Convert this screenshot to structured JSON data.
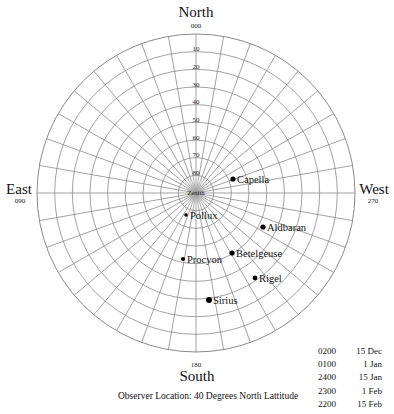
{
  "directions": {
    "north": {
      "label": "North",
      "degrees": "000"
    },
    "east": {
      "label": "East",
      "degrees": "090"
    },
    "west": {
      "label": "West",
      "degrees": "270"
    },
    "south": {
      "label": "South",
      "degrees": "180"
    }
  },
  "zenith_label": "Zenith",
  "altitude_labels": [
    "10",
    "20",
    "30",
    "40",
    "50",
    "60",
    "70",
    "80"
  ],
  "stars": [
    {
      "name": "Capella",
      "x": 233,
      "y": 179,
      "size": 2.6
    },
    {
      "name": "Pollux",
      "x": 186,
      "y": 215,
      "size": 1.8
    },
    {
      "name": "Aldbaran",
      "x": 263,
      "y": 227,
      "size": 2.6
    },
    {
      "name": "Betelgeuse",
      "x": 232,
      "y": 253,
      "size": 2.6
    },
    {
      "name": "Procyon",
      "x": 183,
      "y": 259,
      "size": 2.0
    },
    {
      "name": "Rigel",
      "x": 255,
      "y": 278,
      "size": 2.4
    },
    {
      "name": "Sirius",
      "x": 209,
      "y": 300,
      "size": 3.0
    }
  ],
  "observer_location": "Observer Location: 40 Degrees North Lattitude",
  "viewing_times": [
    {
      "time": "0200",
      "date": "15 Dec"
    },
    {
      "time": "0100",
      "date": "1 Jan"
    },
    {
      "time": "2400",
      "date": "15 Jan"
    },
    {
      "time": "2300",
      "date": "1 Feb"
    },
    {
      "time": "2200",
      "date": "15 Feb"
    }
  ],
  "colors": {
    "grid": "#8a8a8a",
    "star": "#000000",
    "text": "#111111"
  }
}
